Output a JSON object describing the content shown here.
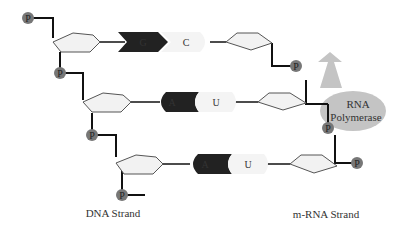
{
  "labels": {
    "dna_strand": "DNA Strand",
    "mrna_strand": "m-RNA Strand",
    "polymerase_line1": "RNA",
    "polymerase_line2": "Polymerase",
    "phosphate": "P"
  },
  "base_pairs": [
    {
      "dna_base": "G",
      "rna_base": "C",
      "dna_shape": "chevron"
    },
    {
      "dna_base": "A",
      "rna_base": "U",
      "dna_shape": "rounded"
    },
    {
      "dna_base": "A",
      "rna_base": "U",
      "dna_shape": "rounded"
    }
  ],
  "colors": {
    "phosphate": "#777777",
    "sugar_fill": "#f2f2f2",
    "dna_base": "#222222",
    "rna_base": "#f4f4f4",
    "polymerase": "#c4c4c4",
    "backbone": "#111111"
  }
}
